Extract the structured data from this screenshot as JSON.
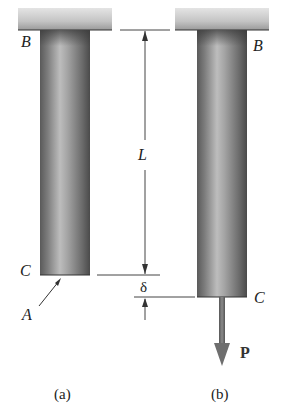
{
  "figure": {
    "panels": [
      {
        "id": "a",
        "caption": "(a)"
      },
      {
        "id": "b",
        "caption": "(b)"
      }
    ],
    "labels": {
      "top_end_left": "B",
      "top_end_right": "B",
      "bottom_end_left": "C",
      "bottom_end_right": "C",
      "cross_section": "A",
      "length": "L",
      "elongation": "δ",
      "load": "P"
    },
    "colors": {
      "support_light": "#dcdcdc",
      "support_dark": "#9a9a9a",
      "bar_dark": "#4a4a4a",
      "bar_light": "#b8b8b8",
      "load_arrow": "#6e6e6e",
      "dimension_line": "#444444"
    }
  }
}
